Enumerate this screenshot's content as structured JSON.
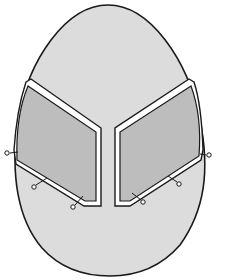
{
  "diagram": {
    "colors": {
      "egg_fill": "#dcdcdc",
      "panel_fill": "#bdbdbd",
      "outline": "#1a1a1a",
      "edge_strip": "#ffffff",
      "background": "#ffffff"
    },
    "shapes": [
      {
        "id": "egg",
        "label": ""
      },
      {
        "id": "left-panel",
        "label": ""
      },
      {
        "id": "right-panel",
        "label": ""
      }
    ],
    "pins": {
      "left_count": 3,
      "right_count": 3
    }
  }
}
